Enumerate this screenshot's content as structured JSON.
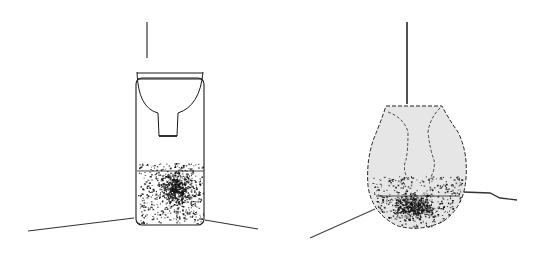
{
  "figure": {
    "panels": [
      {
        "id": "left",
        "vessel_shape": "rectangular-with-funnel-insert",
        "fill_fraction": 0.35,
        "particle_count": 900,
        "colors": {
          "vessel_fill": "#ffffff",
          "stroke": "#1a1a1a",
          "particles": "#111111"
        }
      },
      {
        "id": "right",
        "vessel_shape": "bulb-flask",
        "fill_fraction": 0.25,
        "particle_count": 900,
        "colors": {
          "vessel_fill": "#e6e6e6",
          "stroke": "#1a1a1a",
          "particles": "#111111"
        }
      }
    ]
  }
}
